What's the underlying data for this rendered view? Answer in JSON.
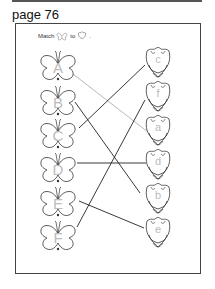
{
  "page": {
    "label": "page 76"
  },
  "instruction": {
    "prefix": "Match",
    "middle": "to",
    "suffix": "."
  },
  "butterflies": [
    {
      "letter": "A",
      "cx": 58,
      "cy": 68
    },
    {
      "letter": "B",
      "cx": 58,
      "cy": 103
    },
    {
      "letter": "C",
      "cx": 58,
      "cy": 136
    },
    {
      "letter": "D",
      "cx": 58,
      "cy": 170
    },
    {
      "letter": "E",
      "cx": 58,
      "cy": 204
    },
    {
      "letter": "F",
      "cx": 58,
      "cy": 238
    }
  ],
  "tulips": [
    {
      "letter": "c",
      "cx": 158,
      "cy": 63
    },
    {
      "letter": "f",
      "cx": 158,
      "cy": 97
    },
    {
      "letter": "a",
      "cx": 158,
      "cy": 131
    },
    {
      "letter": "d",
      "cx": 158,
      "cy": 165
    },
    {
      "letter": "b",
      "cx": 158,
      "cy": 199
    },
    {
      "letter": "e",
      "cx": 158,
      "cy": 233
    }
  ],
  "connections": [
    {
      "from": "A",
      "to": "a",
      "color": "#b0b0b0"
    },
    {
      "from": "B",
      "to": "b",
      "color": "#222222"
    },
    {
      "from": "C",
      "to": "c",
      "color": "#222222"
    },
    {
      "from": "D",
      "to": "d",
      "color": "#222222"
    },
    {
      "from": "E",
      "to": "e",
      "color": "#222222"
    },
    {
      "from": "F",
      "to": "f",
      "color": "#222222"
    }
  ]
}
